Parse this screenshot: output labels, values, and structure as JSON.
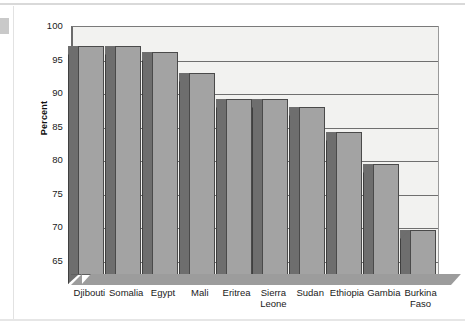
{
  "chart_data": {
    "type": "bar",
    "title": "",
    "subtitle": "",
    "xlabel": "",
    "ylabel": "Percent",
    "ylim": [
      63,
      100
    ],
    "yticks": [
      65,
      70,
      75,
      80,
      85,
      90,
      95,
      100
    ],
    "ytick_labels": [
      "65",
      "70",
      "75",
      "80",
      "85",
      "90",
      "95",
      "100"
    ],
    "grid": true,
    "legend": "none",
    "categories": [
      "Djibouti",
      "Somalia",
      "Egypt",
      "Mali",
      "Eritrea",
      "Sierra Leone",
      "Sudan",
      "Ethiopia",
      "Gambia",
      "Burkina Faso"
    ],
    "values": [
      97.2,
      97.2,
      96.3,
      93.1,
      89.3,
      89.3,
      88.1,
      84.4,
      79.5,
      69.7
    ],
    "bar_face_color": "#a3a3a3",
    "bar_side_color": "#6e6e6e",
    "plot_background": "#f2f2f0",
    "gridline_color": "#6f6f6f",
    "axis_color": "#5f5f5f"
  },
  "axis": {
    "y_title": "Percent"
  }
}
